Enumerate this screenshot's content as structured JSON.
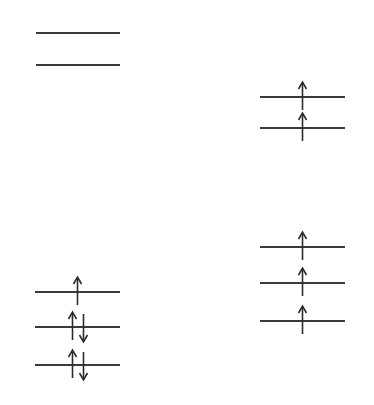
{
  "diagram": {
    "type": "orbital-energy-level-diagram",
    "line_color": "#3a3a3a",
    "groups": [
      {
        "name": "left-upper",
        "x1": 36,
        "x2": 120,
        "levels": [
          {
            "y": 33,
            "electrons": []
          },
          {
            "y": 65,
            "electrons": []
          }
        ]
      },
      {
        "name": "right-upper",
        "x1": 260,
        "x2": 345,
        "levels": [
          {
            "y": 97,
            "electrons": [
              "up"
            ]
          },
          {
            "y": 128,
            "electrons": [
              "up"
            ]
          }
        ]
      },
      {
        "name": "right-lower",
        "x1": 260,
        "x2": 345,
        "levels": [
          {
            "y": 247,
            "electrons": [
              "up"
            ]
          },
          {
            "y": 283,
            "electrons": [
              "up"
            ]
          },
          {
            "y": 321,
            "electrons": [
              "up"
            ]
          }
        ]
      },
      {
        "name": "left-lower",
        "x1": 35,
        "x2": 120,
        "levels": [
          {
            "y": 292,
            "electrons": [
              "up"
            ]
          },
          {
            "y": 327,
            "electrons": [
              "up",
              "down"
            ]
          },
          {
            "y": 365,
            "electrons": [
              "up",
              "down"
            ]
          }
        ]
      }
    ]
  }
}
